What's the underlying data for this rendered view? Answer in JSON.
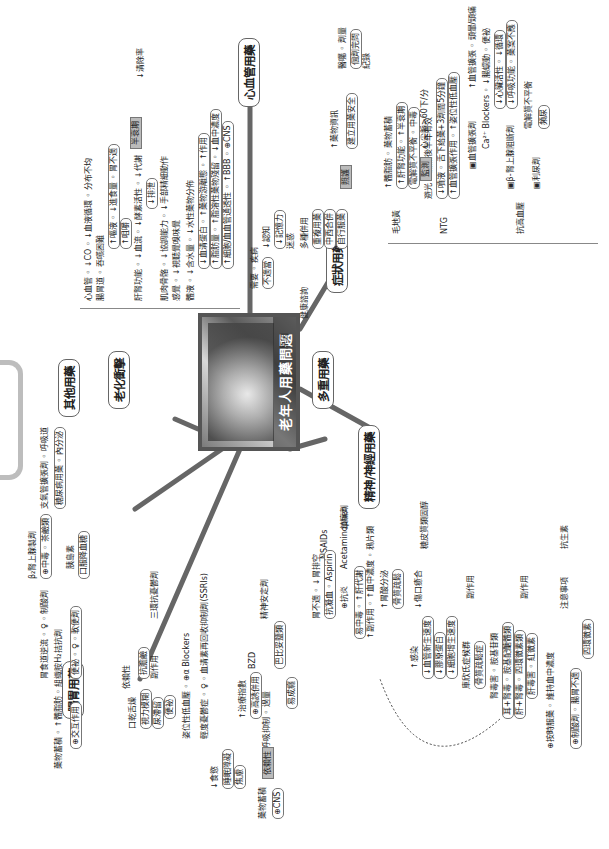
{
  "center": {
    "title": "老年人用藥問題"
  },
  "topics": {
    "cardio": "心血管用藥",
    "symptom": "症狀用藥",
    "psych": "精神/神經用藥",
    "gi": "腸胃用藥",
    "other": "其他用藥",
    "aging": "老化衝擊",
    "poly": "多重用藥"
  },
  "cardio": {
    "digoxin": "毛地黃",
    "digoxin_items": [
      "↑體脂肪 ◦ 藥物蓄積",
      "↑肝腎功能 ◦ ↑半衰期",
      "電解質不平衡 ◦ 中毒"
    ],
    "ntg": "NTG",
    "ntg_items": [
      "避光 ◦ 開瓶後半年有效",
      "↓噴液 ◦ 舌下給藥+3劑間5分鐘",
      "↑血管擴張作用 ◦ ↑姿位性低血壓"
    ],
    "antihtn": "抗高血壓",
    "vasodilator": "▣血管擴張劑",
    "vasodilator_items": [
      "↑血管擴張 ◦ 頭暈/頭痛"
    ],
    "ca_blocker": "Ca²⁺ Blockers ◦ ↓腸蠕動 ◦ 便祕",
    "ca_items": [
      "↓心臟活性 ◦ ↓循環"
    ],
    "beta": "▣β-腎上腺阻斷劑",
    "beta_items": [
      "↓呼吸功能 ◦ 藥案不應"
    ],
    "diuretic": "▣利尿劑",
    "diuretic_items": [
      "電解質不平衡",
      "頻尿"
    ],
    "monitor": "監測",
    "monitor_item": "心尖脈>60下/分"
  },
  "poly": {
    "cause": "原因",
    "need": "需要 ◦ 疾病",
    "improper": "不適當",
    "improper_items": [
      "↓認知",
      "↓記憶力",
      "迷惑"
    ],
    "edu": "健康諮詢",
    "edu_items": [
      "多種併用",
      "重複用藥",
      "中西合併",
      "自行服藥"
    ],
    "care": "照護",
    "care_items": [
      "↑藥物資訊",
      "建立用藥安全"
    ],
    "safety_items": [
      "醫囑 ◦ 劑量",
      "個劑完問",
      "紀錄"
    ]
  },
  "aging": {
    "half_life": "半衰期",
    "clearance": "↓清除率",
    "rows": [
      "心血管 ◦ ↓CO ◦ ↓血液循環 ◦ 分布不均",
      "腸胃道 ◦ 吞嚥困難",
      "↑嘔液 ◦ ↓進食量 ◦ 胃不適",
      "↑咀嚼",
      "肝腎功能 ◦ ↓血流 ◦ ↓酵素活性 ◦ ↓代謝",
      "↓排泄",
      "肌肉骨骼 ◦ ↓協調能力 ◦ ↓手部精細動作",
      "感覺 ◦ ↓視聽覺嗅味覺",
      "體液 ◦ ↓含水量 ◦ ↓水性藥物分佈",
      "↓血清蛋白 ◦ ↑藥物游離態 ◦ ↑作用",
      "↑脂肪量 ◦ ↑脂溶性藥物殘留 ◦ ↓血中濃度",
      "↑細胞/血血管通透性 ◦ ↑BBB ◦ ⊕CNS"
    ]
  },
  "other": {
    "rows": [
      "支氣管擴張劑 ◦ 呼吸道",
      "糖尿病用藥 ◦ 內分泌"
    ],
    "sub1": [
      "⊕中毒 ◦ 茶鹼類",
      "β₂腎上腺製劑"
    ],
    "sub2": [
      "胰島素",
      "口服降血糖"
    ]
  },
  "gi": {
    "rows": [
      "胃食道逆流 ◦ ♀ ◦ 制酸劑",
      "藥物蓄積 ◦ ↑體脂肪 ◦ 組織胺H₂拮抗劑",
      "便祕 ◦ ♀ ◦ 軟便劑"
    ],
    "interaction": "⊕交互作用"
  },
  "psych": {
    "tca": "三環抗憂鬱劑",
    "tca_side": "副作用",
    "tca_anticholinergic": "抗膽鹼",
    "tca_items": [
      "口乾舌燥",
      "視力模糊",
      "尿滯留",
      "便祕"
    ],
    "tca_ortho": "姿位性低血壓 ◦ ⊕α Blockers",
    "ssri": "輕度憂鬱症 ◦ ♀ ◦ 血清素再回收抑制劑(SSRIs)",
    "ssri_items": [
      "↓食慾",
      "睡眠障礙",
      "焦慮"
    ],
    "bzd": "精神安定劑",
    "bzd_sub": "BZD",
    "bzd_items": [
      "↑治療指數",
      "⊕高誘併用",
      "呼吸抑制 ◦ 過量"
    ],
    "barbiturate": "巴比妥鹽類",
    "barbiturate_item": "易成癮",
    "dependence": "依賴性",
    "dep_items": [
      "藥物蓄積",
      "⊕CNS"
    ],
    "dep_arrow": "依賴性"
  },
  "symptom": {
    "analgesic": "鎮痛劑",
    "nsaid": "NSAIDs",
    "nsaid_items": [
      "胃不適 ◦ ↓胃排空",
      "抗凝血 ◦ Aspirin"
    ],
    "acetaminophen": "Acetaminophen",
    "acet_items": [
      "⊕抗炎",
      "易中毒 ◦ ↑肝代謝",
      "↑副作用 ◦ ↑血中濃度 ◦ 鴉片類"
    ],
    "opioid_items": [
      "↑胃酸分泌",
      "骨質疏鬆"
    ],
    "steroid": "糖皮質類固醇",
    "wound": "↓傷口癒合",
    "wound_items": [
      "↑感染",
      "↓血管新生速度",
      "↓膠原蛋白",
      "↓細胞增生速度"
    ],
    "steroid_side": "副作用",
    "steroid_side_items": [
      "庫欣氏症候群",
      "骨質疏鬆症"
    ],
    "antibiotic": "抗生素",
    "abx_side": "副作用",
    "abx_side_items": [
      "腎毒害 ◦ 胺基苷類",
      "耳+腎毒 ◦ 胺基配醣體類",
      "肝+腎毒 ◦ 四環黴素類",
      "肝毒害 ◦ 紅黴素"
    ],
    "abx_note": "注意事項",
    "abx_note_items": [
      "⊕按時服藥 ◦ 維持血中濃度",
      "⊕制酸劑 ◦ 腸胃不適",
      "四環黴素"
    ]
  },
  "colors": {
    "line": "#888888",
    "branch": "#666666",
    "highlight_box": "#bbbbbb"
  }
}
